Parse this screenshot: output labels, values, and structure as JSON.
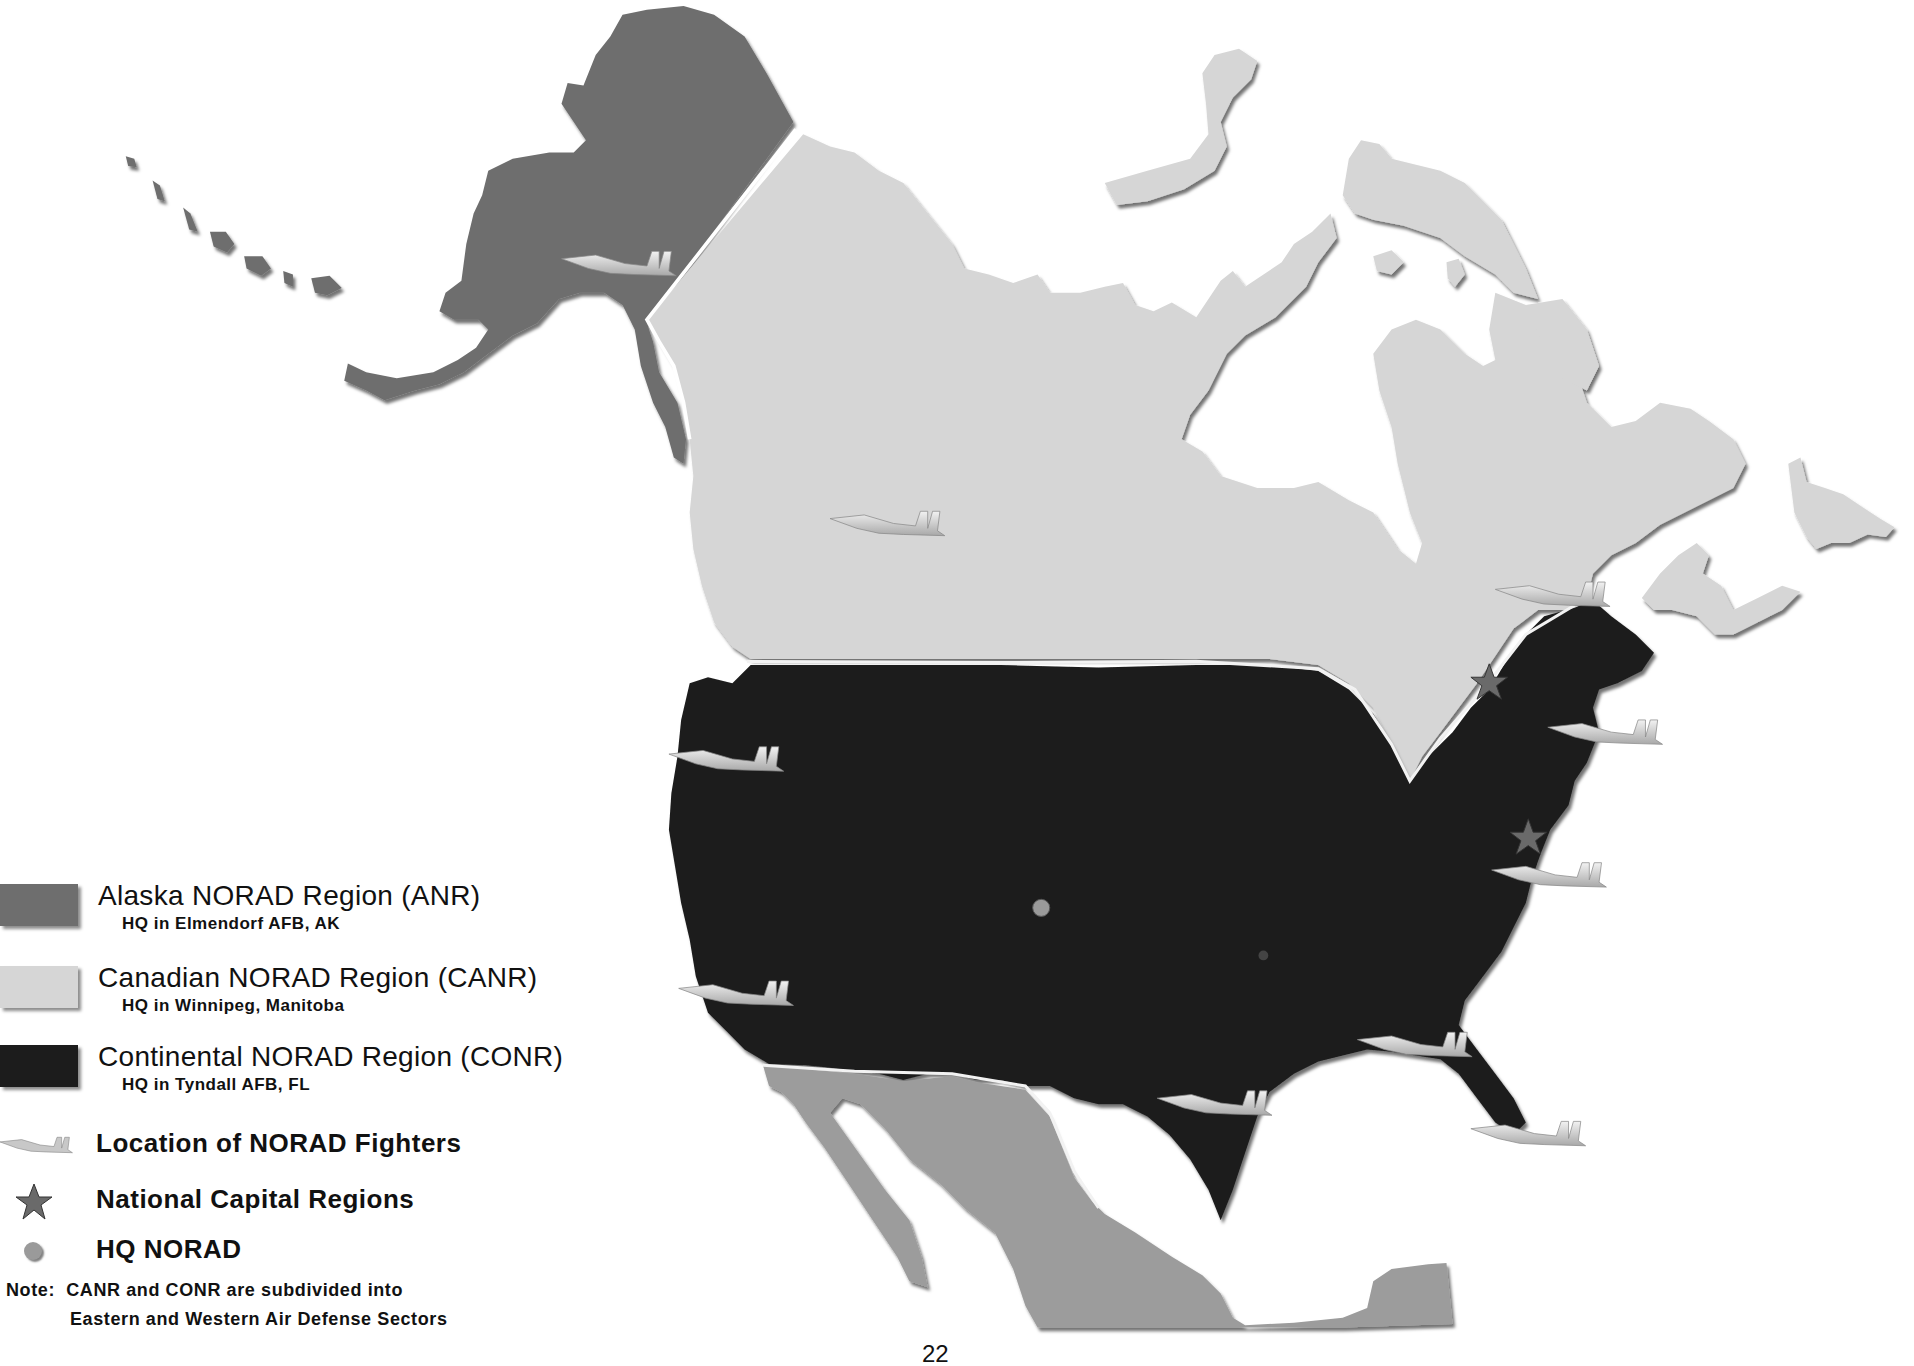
{
  "map": {
    "title": "NORAD Regions of North America",
    "regions": [
      {
        "id": "anr",
        "name": "Alaska NORAD Region (ANR)",
        "hq": "HQ in Elmendorf AFB, AK",
        "color": "#6e6e6e"
      },
      {
        "id": "canr",
        "name": "Canadian NORAD Region (CANR)",
        "hq": "HQ in Winnipeg, Manitoba",
        "color": "#d6d6d6"
      },
      {
        "id": "conr",
        "name": "Continental NORAD Region (CONR)",
        "hq": "HQ in Tyndall AFB, FL",
        "color": "#1c1c1c"
      }
    ],
    "other_land_color": "#9c9c9c",
    "symbols": {
      "fighters": {
        "label": "Location of NORAD Fighters",
        "icon": "fighter-jet-icon"
      },
      "capitals": {
        "label": "National Capital Regions",
        "icon": "star-icon",
        "color": "#6a6a6a"
      },
      "hq": {
        "label": "HQ NORAD",
        "icon": "dot-icon",
        "color": "#9a9a9a"
      }
    },
    "note": {
      "line1": "Note:  CANR and CONR are subdivided into",
      "line2": "Eastern and Western Air Defense Sectors"
    },
    "page_number": "22"
  }
}
